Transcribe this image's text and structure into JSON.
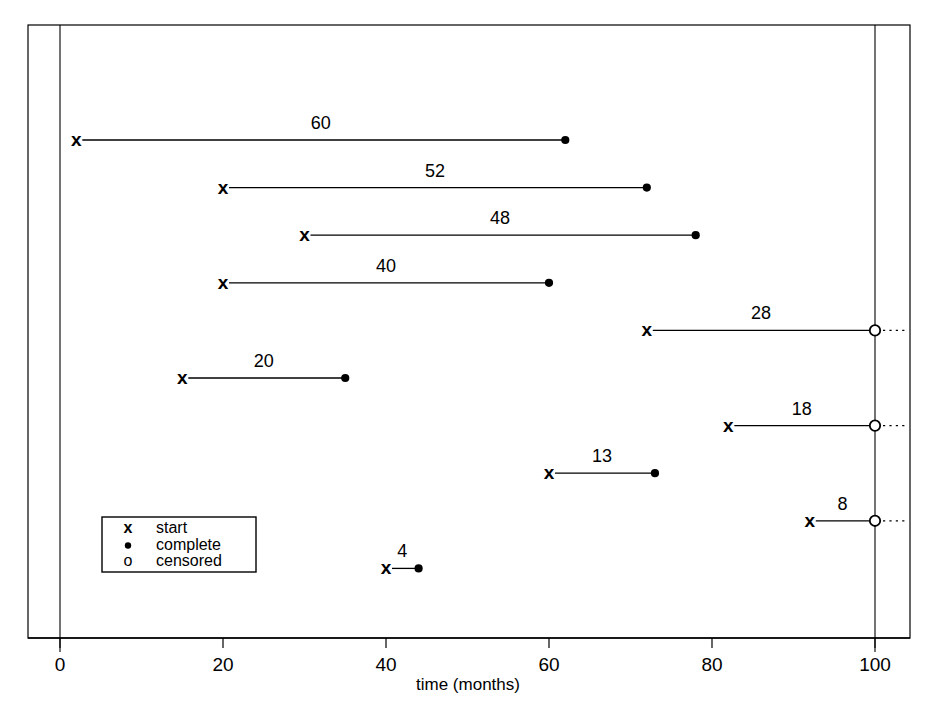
{
  "chart_data": {
    "type": "bar",
    "title": "",
    "subtitle": "",
    "xlabel": "time (months)",
    "ylabel": "",
    "xlim": [
      0,
      100
    ],
    "xticks": [
      0,
      20,
      40,
      60,
      80,
      100
    ],
    "xticklabels": [
      "0",
      "20",
      "40",
      "60",
      "80",
      "100"
    ],
    "grid": false,
    "legend_position": "bottom-left",
    "orientation": "horizontal",
    "series": [
      {
        "name": "start",
        "symbol": "x",
        "marker": "x-cross"
      },
      {
        "name": "complete",
        "symbol": "●",
        "marker": "filled-dot"
      },
      {
        "name": "censored",
        "symbol": "o",
        "marker": "open-circle"
      }
    ],
    "legend": [
      {
        "symbol": "x",
        "label": "start"
      },
      {
        "symbol": "●",
        "label": "complete"
      },
      {
        "symbol": "o",
        "label": "censored"
      }
    ],
    "rows": [
      {
        "index": 1,
        "start": 2,
        "end": 62,
        "duration": 60,
        "label": "60",
        "status": "complete"
      },
      {
        "index": 2,
        "start": 20,
        "end": 72,
        "duration": 52,
        "label": "52",
        "status": "complete"
      },
      {
        "index": 3,
        "start": 30,
        "end": 78,
        "duration": 48,
        "label": "48",
        "status": "complete"
      },
      {
        "index": 4,
        "start": 20,
        "end": 60,
        "duration": 40,
        "label": "40",
        "status": "complete"
      },
      {
        "index": 5,
        "start": 72,
        "end": 100,
        "duration": 28,
        "label": "28",
        "status": "censored"
      },
      {
        "index": 6,
        "start": 15,
        "end": 35,
        "duration": 20,
        "label": "20",
        "status": "complete"
      },
      {
        "index": 7,
        "start": 82,
        "end": 100,
        "duration": 18,
        "label": "18",
        "status": "censored"
      },
      {
        "index": 8,
        "start": 60,
        "end": 73,
        "duration": 13,
        "label": "13",
        "status": "complete"
      },
      {
        "index": 9,
        "start": 92,
        "end": 100,
        "duration": 8,
        "label": "8",
        "status": "censored"
      },
      {
        "index": 10,
        "start": 40,
        "end": 44,
        "duration": 4,
        "label": "4",
        "status": "complete"
      }
    ],
    "categories": [
      "1",
      "2",
      "3",
      "4",
      "5",
      "6",
      "7",
      "8",
      "9",
      "10"
    ],
    "values": [
      60,
      52,
      48,
      40,
      28,
      20,
      18,
      13,
      8,
      4
    ],
    "reference_lines": [
      {
        "value": 0,
        "style": "solid"
      },
      {
        "value": 100,
        "style": "solid"
      }
    ],
    "colors": {
      "foreground": "#000000",
      "background": "#ffffff",
      "line": "#000000"
    }
  }
}
